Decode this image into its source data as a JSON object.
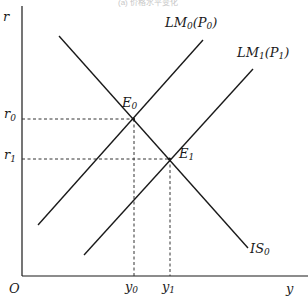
{
  "diagram": {
    "title_fragment": "(a) 价格水平变化",
    "axes": {
      "y_label": "r",
      "x_label": "y",
      "origin_label": "O"
    },
    "curves": [
      {
        "id": "IS0",
        "name": "IS",
        "sub": "0",
        "paren": ""
      },
      {
        "id": "LM0",
        "name": "LM",
        "sub": "0",
        "paren_name": "P",
        "paren_sub": "0"
      },
      {
        "id": "LM1",
        "name": "LM",
        "sub": "1",
        "paren_name": "P",
        "paren_sub": "1"
      }
    ],
    "equilibria": [
      {
        "id": "E0",
        "name": "E",
        "sub": "0"
      },
      {
        "id": "E1",
        "name": "E",
        "sub": "1"
      }
    ],
    "y_ticks": [
      {
        "name": "r",
        "sub": "0"
      },
      {
        "name": "r",
        "sub": "1"
      }
    ],
    "x_ticks": [
      {
        "name": "y",
        "sub": "0"
      },
      {
        "name": "y",
        "sub": "1"
      }
    ],
    "colors": {
      "line": "#1a1a1a",
      "dash": "#333333"
    }
  }
}
